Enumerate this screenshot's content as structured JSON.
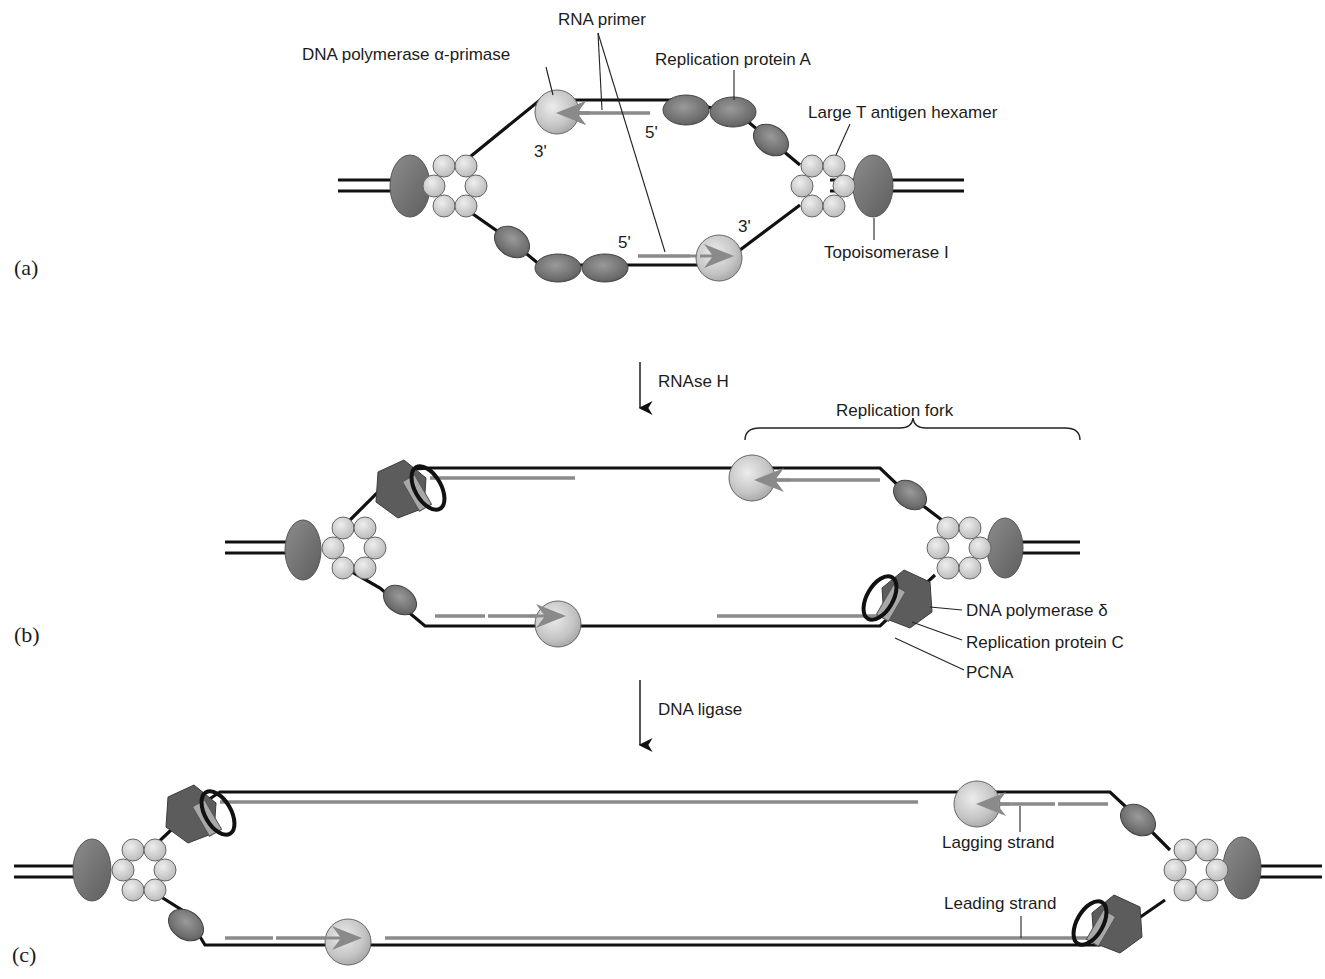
{
  "figure": {
    "panels": [
      {
        "id": "a",
        "label": "(a)"
      },
      {
        "id": "b",
        "label": "(b)"
      },
      {
        "id": "c",
        "label": "(c)"
      }
    ],
    "steps": [
      {
        "label": "RNAse H"
      },
      {
        "label": "DNA ligase"
      }
    ],
    "labels_a": {
      "rna_primer": "RNA primer",
      "pol_alpha": "DNA polymerase α-primase",
      "rpa": "Replication protein A",
      "t_antigen": "Large T antigen hexamer",
      "topo": "Topoisomerase I",
      "three_prime_top": "3'",
      "five_prime_top": "5'",
      "five_prime_bottom": "5'",
      "three_prime_bottom": "3'"
    },
    "labels_b": {
      "fork": "Replication fork",
      "pol_delta": "DNA polymerase δ",
      "rfc": "Replication protein C",
      "pcna": "PCNA"
    },
    "labels_c": {
      "lagging": "Lagging strand",
      "leading": "Leading strand"
    },
    "colors": {
      "parental_strand": "#111111",
      "new_strand": "#8a8a8a",
      "rpa_protein": "#6e6e6e",
      "polymerase_alpha": "#c8c8c8",
      "t_antigen": "#d0d0d0",
      "pol_delta": "#5c5c5c",
      "rfc_clamp_loader": "#a8a8a8"
    }
  }
}
